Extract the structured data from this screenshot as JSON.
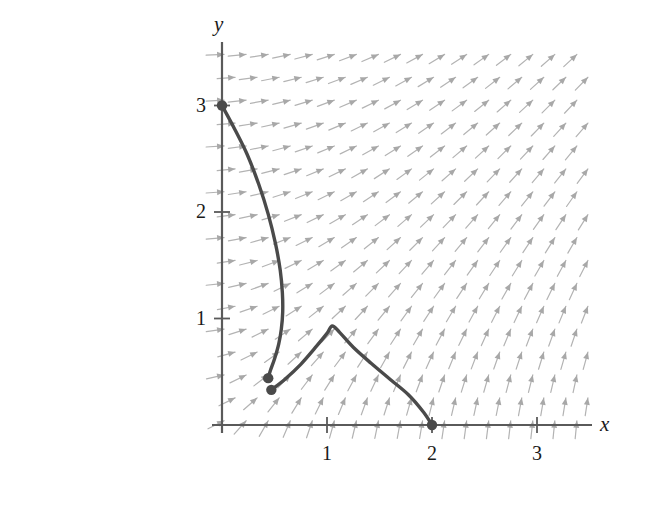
{
  "figure": {
    "kind": "slope-field-with-solution-curves",
    "background_color": "#ffffff",
    "axis_color": "#5a5a5a",
    "curve_color": "#4a4a4a",
    "arrow_color": "#b0b0b0",
    "text_color": "#1a1a1a"
  },
  "axes": {
    "x_label": "x",
    "y_label": "y",
    "x_ticks": [
      {
        "value": 1,
        "label": "1"
      },
      {
        "value": 2,
        "label": "2"
      },
      {
        "value": 3,
        "label": "3"
      }
    ],
    "y_ticks": [
      {
        "value": 1,
        "label": "1"
      },
      {
        "value": 2,
        "label": "2"
      },
      {
        "value": 3,
        "label": "3"
      }
    ],
    "origin_px": [
      222,
      425
    ],
    "unit_px": [
      105,
      106.5
    ],
    "xlim": [
      0,
      3.6
    ],
    "ylim": [
      0,
      3.6
    ]
  },
  "chart_data": {
    "type": "scatter",
    "title": "",
    "xlabel": "x",
    "ylabel": "y",
    "xlim": [
      0,
      3.6
    ],
    "ylim": [
      0,
      3.6
    ],
    "grid": false,
    "legend": "none",
    "vector_field": {
      "description": "direction field arrows rotating counterclockwise with increasing x: vertical up near the y-axis, up-left, left, then down-left and down toward the right and top of the plot",
      "grid_spacing_x": 0.21,
      "grid_spacing_y": 0.215,
      "row_offset_x": 0.105,
      "arrow_length_px": 18,
      "color": "#b3b3b3"
    },
    "series": [
      {
        "name": "solution-curve-1",
        "type": "line",
        "points": [
          [
            0.0,
            3.0
          ],
          [
            0.12,
            2.78
          ],
          [
            0.24,
            2.54
          ],
          [
            0.35,
            2.26
          ],
          [
            0.44,
            1.98
          ],
          [
            0.51,
            1.7
          ],
          [
            0.555,
            1.45
          ],
          [
            0.575,
            1.24
          ],
          [
            0.578,
            1.06
          ],
          [
            0.565,
            0.9
          ],
          [
            0.54,
            0.76
          ],
          [
            0.5,
            0.62
          ],
          [
            0.46,
            0.51
          ],
          [
            0.44,
            0.44
          ]
        ],
        "endpoints": [
          {
            "label": "start",
            "x": 0.0,
            "y": 3.0,
            "marker": "filled-circle"
          },
          {
            "label": "end",
            "x": 0.44,
            "y": 0.44,
            "marker": "filled-circle"
          }
        ]
      },
      {
        "name": "solution-curve-2",
        "type": "line",
        "points": [
          [
            0.47,
            0.33
          ],
          [
            0.6,
            0.43
          ],
          [
            0.75,
            0.57
          ],
          [
            0.9,
            0.74
          ],
          [
            1.0,
            0.86
          ],
          [
            1.05,
            0.93
          ],
          [
            1.12,
            0.87
          ],
          [
            1.25,
            0.73
          ],
          [
            1.42,
            0.58
          ],
          [
            1.6,
            0.43
          ],
          [
            1.78,
            0.28
          ],
          [
            1.92,
            0.12
          ],
          [
            2.0,
            0.0
          ]
        ],
        "endpoints": [
          {
            "label": "start",
            "x": 0.47,
            "y": 0.33,
            "marker": "filled-circle"
          },
          {
            "label": "end",
            "x": 2.0,
            "y": 0.0,
            "marker": "filled-circle"
          }
        ]
      }
    ]
  }
}
